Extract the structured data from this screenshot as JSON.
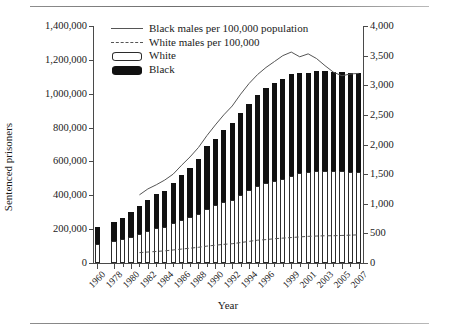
{
  "figure": {
    "rule_top": "horizontal-rule",
    "rule_bottom": "horizontal-rule"
  },
  "axes": {
    "left_title": "Sentenced prisoners",
    "right_title": "Sentenced prisoners per 100,000 population",
    "x_title": "Year"
  },
  "legend": {
    "items": [
      {
        "label": "Black males per 100,000 population",
        "key": "solid-line",
        "color": "#555555"
      },
      {
        "label": "White males per 100,000",
        "key": "dashed-line",
        "color": "#555555"
      },
      {
        "label": "White",
        "key": "white-swatch",
        "color": "#ffffff"
      },
      {
        "label": "Black",
        "key": "black-swatch",
        "color": "#111111"
      }
    ]
  },
  "chart_data": {
    "type": "bar",
    "title": "",
    "subtitle": "",
    "xlabel": "Year",
    "ylabel": "Sentenced prisoners",
    "y2label": "Sentenced prisoners per 100,000 population",
    "ylim": [
      0,
      1400000
    ],
    "y2lim": [
      0,
      4000
    ],
    "ytick_labels": [
      "0",
      "200,000",
      "400,000",
      "600,000",
      "800,000",
      "1,000,000",
      "1,200,000",
      "1,400,000"
    ],
    "ytick_values": [
      0,
      200000,
      400000,
      600000,
      800000,
      1000000,
      1200000,
      1400000
    ],
    "y2tick_labels": [
      "0",
      "500",
      "1,000",
      "1,500",
      "2,000",
      "2,500",
      "3,000",
      "3,500",
      "4,000"
    ],
    "y2tick_values": [
      0,
      500,
      1000,
      1500,
      2000,
      2500,
      3000,
      3500,
      4000
    ],
    "grid": false,
    "legend_position": "top-left",
    "categories": [
      "1960",
      "1978",
      "1979",
      "1980",
      "1981",
      "1982",
      "1983",
      "1984",
      "1985",
      "1986",
      "1987",
      "1988",
      "1989",
      "1990",
      "1991",
      "1992",
      "1993",
      "1994",
      "1995",
      "1996",
      "1997",
      "1998",
      "1999",
      "2000",
      "2001",
      "2002",
      "2003",
      "2004",
      "2005",
      "2006",
      "2007"
    ],
    "xtick_labels": [
      "1960",
      "1978",
      "1980",
      "1982",
      "1984",
      "1986",
      "1988",
      "1990",
      "1992",
      "1994",
      "1996",
      "1999",
      "2001",
      "2003",
      "2005",
      "2007"
    ],
    "axis_break_after_category": "1960",
    "series": [
      {
        "name": "White",
        "stack": "prisoners",
        "axis": "left",
        "fill": "#ffffff",
        "edge": "#2b2b2b",
        "values": [
          115000,
          130000,
          140000,
          152000,
          170000,
          190000,
          205000,
          215000,
          235000,
          255000,
          270000,
          290000,
          320000,
          340000,
          360000,
          375000,
          400000,
          430000,
          455000,
          470000,
          485000,
          495000,
          515000,
          530000,
          540000,
          545000,
          545000,
          545000,
          545000,
          540000,
          540000
        ]
      },
      {
        "name": "Black",
        "stack": "prisoners",
        "axis": "left",
        "fill": "#111111",
        "edge": "#111111",
        "values": [
          95000,
          115000,
          125000,
          150000,
          165000,
          185000,
          200000,
          210000,
          235000,
          265000,
          290000,
          325000,
          370000,
          395000,
          425000,
          455000,
          485000,
          510000,
          540000,
          565000,
          580000,
          590000,
          600000,
          595000,
          585000,
          590000,
          590000,
          585000,
          585000,
          585000,
          585000
        ]
      },
      {
        "name": "Black males per 100,000 population",
        "type": "line",
        "style": "solid",
        "axis": "right",
        "color": "#555555",
        "values": [
          null,
          null,
          null,
          null,
          1150,
          1250,
          1320,
          1400,
          1500,
          1650,
          1790,
          1950,
          2150,
          2330,
          2500,
          2650,
          2850,
          3030,
          3180,
          3300,
          3400,
          3500,
          3560,
          3480,
          3530,
          3450,
          3330,
          3220,
          3160,
          3190,
          3200
        ]
      },
      {
        "name": "White males per 100,000",
        "type": "line",
        "style": "dashed",
        "axis": "right",
        "color": "#555555",
        "values": [
          null,
          null,
          null,
          null,
          175,
          185,
          195,
          205,
          220,
          235,
          250,
          265,
          285,
          300,
          315,
          325,
          345,
          365,
          385,
          395,
          410,
          420,
          430,
          440,
          450,
          455,
          460,
          460,
          465,
          470,
          475
        ]
      }
    ]
  }
}
